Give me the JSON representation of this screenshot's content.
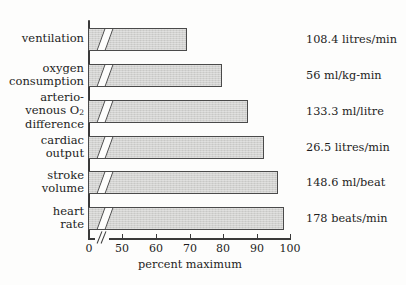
{
  "chart_data": {
    "type": "bar",
    "orientation": "horizontal",
    "title": "",
    "xlabel": "percent maximum",
    "ylabel": "",
    "xlim": [
      0,
      100
    ],
    "axis_break": {
      "from": 0,
      "to": 45,
      "note": "x-axis broken between 0 and 50"
    },
    "grid": false,
    "legend": null,
    "categories": [
      "ventilation",
      "oxygen consumption",
      "arterio-venous O2 difference",
      "cardiac output",
      "stroke volume",
      "heart rate"
    ],
    "values": [
      68,
      78,
      86,
      91,
      94,
      96
    ],
    "tick_values": [
      0,
      50,
      60,
      70,
      80,
      90,
      100
    ],
    "tick_labels": [
      "0",
      "50",
      "60",
      "70",
      "80",
      "90",
      "100"
    ],
    "value_annotations": [
      "108.4 litres/min",
      "56 ml/kg-min",
      "133.3 ml/litre",
      "26.5 litres/min",
      "148.6 ml/beat",
      "178 beats/min"
    ],
    "colors": {
      "bar_fill": "#d2d2d0",
      "bar_edge": "#4a4a4a",
      "axis": "#3a3a3a",
      "text": "#1d1d1d",
      "background": "#fdfdfc"
    }
  },
  "rows": [
    {
      "label_lines": [
        "ventilation"
      ],
      "value": 68,
      "annotation": "108.4 litres/min",
      "bar_top": 28,
      "bar_width": 99,
      "label_top": 32,
      "value_top": 33
    },
    {
      "label_lines": [
        "oxygen",
        "consumption"
      ],
      "value": 78,
      "annotation": "56 ml/kg-min",
      "bar_top": 64,
      "bar_width": 134,
      "label_top": 62,
      "value_top": 69
    },
    {
      "label_lines": [
        "arterio-",
        "venous O2",
        "difference"
      ],
      "value": 86,
      "annotation": "133.3 ml/litre",
      "bar_top": 100,
      "bar_width": 160,
      "label_top": 91,
      "value_top": 105
    },
    {
      "label_lines": [
        "cardiac",
        "output"
      ],
      "value": 91,
      "annotation": "26.5 litres/min",
      "bar_top": 136,
      "bar_width": 176,
      "label_top": 134,
      "value_top": 141
    },
    {
      "label_lines": [
        "stroke",
        "volume"
      ],
      "value": 94,
      "annotation": "148.6 ml/beat",
      "bar_top": 171,
      "bar_width": 190,
      "label_top": 169,
      "value_top": 176
    },
    {
      "label_lines": [
        "heart",
        "rate"
      ],
      "value": 96,
      "annotation": "178 beats/min",
      "bar_top": 207,
      "bar_width": 196,
      "label_top": 205,
      "value_top": 212
    }
  ],
  "ticks": [
    {
      "label": "0",
      "x": 89
    },
    {
      "label": "50",
      "x": 122
    },
    {
      "label": "60",
      "x": 156
    },
    {
      "label": "70",
      "x": 190
    },
    {
      "label": "80",
      "x": 223
    },
    {
      "label": "90",
      "x": 257
    },
    {
      "label": "100",
      "x": 290
    }
  ]
}
